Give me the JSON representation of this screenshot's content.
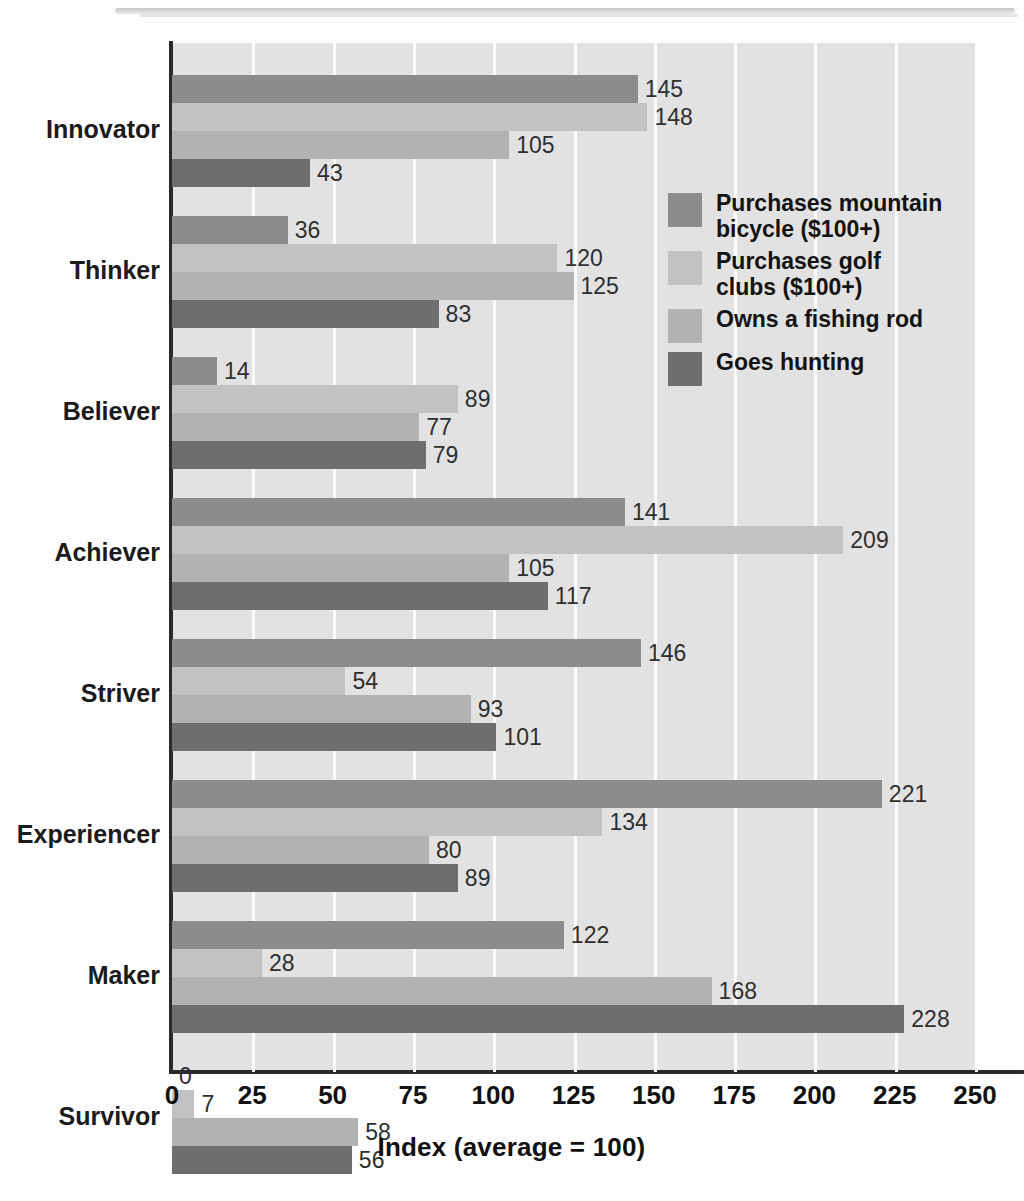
{
  "chart_data": {
    "type": "bar",
    "orientation": "horizontal",
    "title": "",
    "xlabel": "Index (average = 100)",
    "ylabel": "",
    "xlim": [
      0,
      250
    ],
    "xticks": [
      "0",
      "25",
      "50",
      "75",
      "100",
      "125",
      "150",
      "175",
      "200",
      "225",
      "250"
    ],
    "grid": true,
    "legend_position": "inside-upper-right",
    "categories": [
      "Innovator",
      "Thinker",
      "Believer",
      "Achiever",
      "Striver",
      "Experiencer",
      "Maker",
      "Survivor"
    ],
    "series": [
      {
        "name": "Purchases mountain bicycle ($100+)",
        "color": "#8c8c8c",
        "values": [
          145,
          36,
          14,
          141,
          146,
          221,
          122,
          0
        ]
      },
      {
        "name": "Purchases golf clubs ($100+)",
        "color": "#c2c2c2",
        "values": [
          148,
          120,
          89,
          209,
          54,
          134,
          28,
          7
        ]
      },
      {
        "name": "Owns a fishing rod",
        "color": "#b2b2b2",
        "values": [
          105,
          125,
          77,
          105,
          93,
          80,
          168,
          58
        ]
      },
      {
        "name": "Goes hunting",
        "color": "#6e6e6e",
        "values": [
          43,
          83,
          79,
          117,
          101,
          89,
          228,
          56
        ]
      }
    ]
  },
  "legend": {
    "items": [
      {
        "label": "Purchases mountain\nbicycle ($100+)",
        "color": "#8c8c8c"
      },
      {
        "label": "Purchases golf\nclubs ($100+)",
        "color": "#c2c2c2"
      },
      {
        "label": "Owns a fishing rod",
        "color": "#b2b2b2"
      },
      {
        "label": "Goes hunting",
        "color": "#6e6e6e"
      }
    ]
  },
  "style": {
    "plot_background": "#e2e2e2",
    "gridline_color": "#fbfbfb",
    "axis_color": "#2a2a2a",
    "label_color": "#2f2f2f",
    "page_background": "#fdfdfd"
  }
}
